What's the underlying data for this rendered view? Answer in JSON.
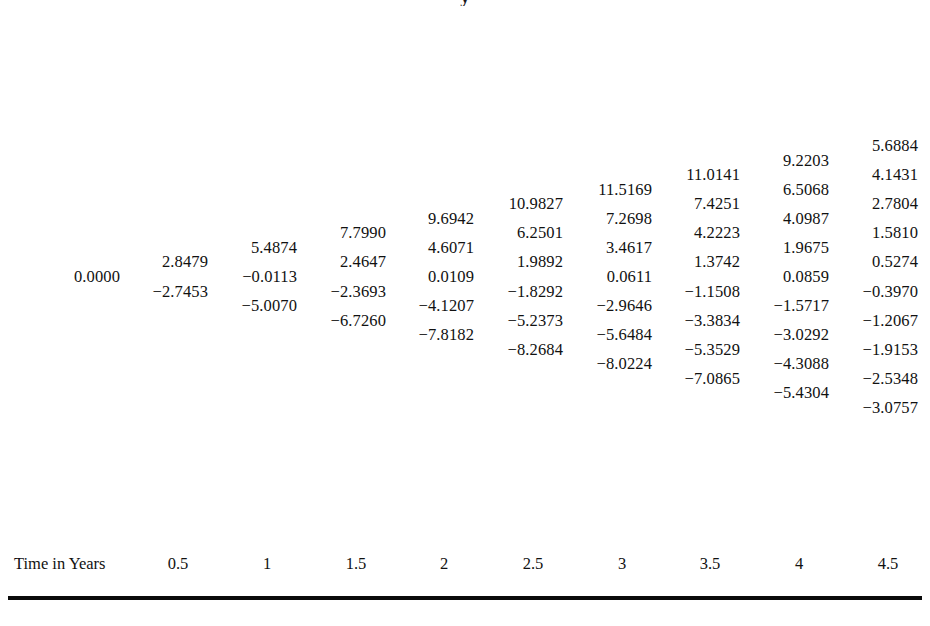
{
  "title_fragment": "y",
  "axis": {
    "label": "Time in Years",
    "ticks": [
      "0.5",
      "1",
      "1.5",
      "2",
      "2.5",
      "3",
      "3.5",
      "4",
      "4.5"
    ]
  },
  "colors": {
    "text": "#111111",
    "rule": "#0a0a0a",
    "background": "#ffffff"
  },
  "chart_data": {
    "type": "table",
    "xlabel": "Time in Years",
    "ylabel": "",
    "grid": false,
    "legend": "none",
    "x": [
      0,
      0.5,
      1,
      1.5,
      2,
      2.5,
      3,
      3.5,
      4,
      4.5
    ],
    "columns": [
      {
        "time": "0",
        "x_px": 120,
        "values": [
          "0.0000"
        ]
      },
      {
        "time": "0.5",
        "x_px": 208,
        "values": [
          "2.8479",
          "-2.7453"
        ]
      },
      {
        "time": "1",
        "x_px": 297,
        "values": [
          "5.4874",
          "-0.0113",
          "-5.0070"
        ]
      },
      {
        "time": "1.5",
        "x_px": 386,
        "values": [
          "7.7990",
          "2.4647",
          "-2.3693",
          "-6.7260"
        ]
      },
      {
        "time": "2",
        "x_px": 474,
        "values": [
          "9.6942",
          "4.6071",
          "0.0109",
          "-4.1207",
          "-7.8182"
        ]
      },
      {
        "time": "2.5",
        "x_px": 563,
        "values": [
          "10.9827",
          "6.2501",
          "1.9892",
          "-1.8292",
          "-5.2373",
          "-8.2684"
        ]
      },
      {
        "time": "3",
        "x_px": 652,
        "values": [
          "11.5169",
          "7.2698",
          "3.4617",
          "0.0611",
          "-2.9646",
          "-5.6484",
          "-8.0224"
        ]
      },
      {
        "time": "3.5",
        "x_px": 740,
        "values": [
          "11.0141",
          "7.4251",
          "4.2223",
          "1.3742",
          "-1.1508",
          "-3.3834",
          "-5.3529",
          "-7.0865"
        ]
      },
      {
        "time": "4",
        "x_px": 829,
        "values": [
          "9.2203",
          "6.5068",
          "4.0987",
          "1.9675",
          "0.0859",
          "-1.5717",
          "-3.0292",
          "-4.3088",
          "-5.4304"
        ]
      },
      {
        "time": "4.5",
        "x_px": 918,
        "values": [
          "5.6884",
          "4.1431",
          "2.7804",
          "1.5810",
          "0.5274",
          "-0.3970",
          "-1.2067",
          "-1.9153",
          "-2.5348",
          "-3.0757"
        ]
      }
    ],
    "row_pitch_px": 29.1,
    "center_y_px": 277,
    "axis_tick_x_px": [
      208,
      297,
      386,
      474,
      563,
      652,
      740,
      829,
      918
    ]
  }
}
